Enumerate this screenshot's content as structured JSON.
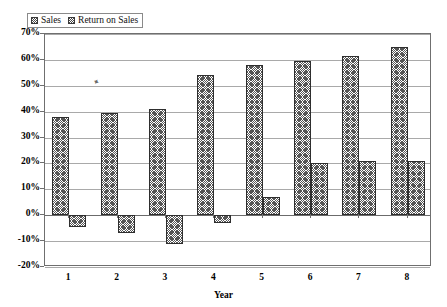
{
  "chart_data": {
    "type": "bar",
    "title": "",
    "subtitle": "",
    "xlabel": "Year",
    "ylabel": "",
    "categories": [
      "1",
      "2",
      "3",
      "4",
      "5",
      "6",
      "7",
      "8"
    ],
    "series": [
      {
        "name": "Sales",
        "values": [
          38,
          39.5,
          41,
          54,
          58,
          59.5,
          61.5,
          65
        ],
        "pattern": "cross-hatch"
      },
      {
        "name": "Return on Sales",
        "values": [
          -4.5,
          -7,
          -11,
          -3,
          7,
          20,
          21,
          21
        ],
        "pattern": "cross-hatch"
      }
    ],
    "ylim": [
      -20,
      70
    ],
    "ytick_labels": [
      "70%",
      "60%",
      "50%",
      "40%",
      "30%",
      "20%",
      "10%",
      "0%",
      "-10%",
      "-20%"
    ],
    "ytick_values": [
      70,
      60,
      50,
      40,
      30,
      20,
      10,
      0,
      -10,
      -20
    ],
    "grid": true,
    "legend_position": "top-left",
    "legend_entries": [
      "Sales",
      "Return on Sales"
    ],
    "value_format": "percent"
  },
  "legend": {
    "entries": [
      {
        "label": "Sales",
        "icon": "hatch-swatch-icon"
      },
      {
        "label": "Return on Sales",
        "icon": "hatch-swatch-icon"
      }
    ]
  },
  "axes": {
    "x_title": "Year",
    "y_ticks": [
      "70%",
      "60%",
      "50%",
      "40%",
      "30%",
      "20%",
      "10%",
      "0%",
      "-10%",
      "-20%"
    ],
    "x_ticks": [
      "1",
      "2",
      "3",
      "4",
      "5",
      "6",
      "7",
      "8"
    ]
  },
  "colors": {
    "axis": "#6f6f6f",
    "grid": "#a9a9a9",
    "bar_outline": "#2e2e2e",
    "bar_hatch": "#555555",
    "background": "#ffffff",
    "text": "#000000"
  }
}
